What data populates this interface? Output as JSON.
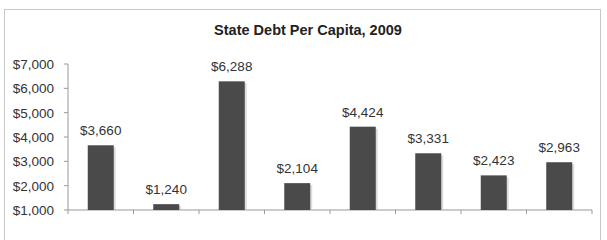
{
  "chart_data": {
    "type": "bar",
    "title": "State Debt Per Capita, 2009",
    "xlabel": "",
    "ylabel": "",
    "categories": [
      "California",
      "Texas",
      "New York",
      "Florida",
      "Illinois",
      "Penn",
      "Ohio",
      "Michigan"
    ],
    "values": [
      3660,
      1240,
      6288,
      2104,
      4424,
      3331,
      2423,
      2963
    ],
    "data_labels": [
      "$3,660",
      "$1,240",
      "$6,288",
      "$2,104",
      "$4,424",
      "$3,331",
      "$2,423",
      "$2,963"
    ],
    "ylim": [
      1000,
      7000
    ],
    "yticks": [
      1000,
      2000,
      3000,
      4000,
      5000,
      6000,
      7000
    ],
    "ytick_labels": [
      "$1,000",
      "$2,000",
      "$3,000",
      "$4,000",
      "$5,000",
      "$6,000",
      "$7,000"
    ],
    "grid": false,
    "legend": "none",
    "bar_color": "#4a4a4a",
    "category_label_style": "small-caps"
  }
}
